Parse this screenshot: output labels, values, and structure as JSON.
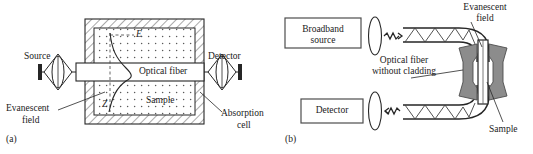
{
  "figure": {
    "panels": [
      {
        "tag": "(a)",
        "title": "Evanescent wave absorption cell with optical fiber",
        "labels": {
          "source": "Source",
          "detector": "Detector",
          "optical_fiber": "Optical fiber",
          "sample": "Sample",
          "evanescent_field_line1": "Evanescent",
          "evanescent_field_line2": "field",
          "absorption_cell_line1": "Absorption",
          "absorption_cell_line2": "cell",
          "axis_field": "E",
          "axis_depth": "Z"
        }
      },
      {
        "tag": "(b)",
        "title": "Fiber-optic evanescent sensor with uncladded fiber loop",
        "labels": {
          "broadband_source_line1": "Broadband",
          "broadband_source_line2": "source",
          "detector": "Detector",
          "optical_fiber_line1": "Optical fiber",
          "optical_fiber_line2": "without cladding",
          "evanescent_field_line1": "Evanescent",
          "evanescent_field_line2": "field",
          "sample": "Sample"
        }
      }
    ]
  },
  "colors": {
    "stroke": "#262626",
    "sample_block": "#8c8c8c",
    "sample_block_dark": "#6e6e6e",
    "fiber_fill": "#ffffff",
    "background": "#ffffff"
  }
}
